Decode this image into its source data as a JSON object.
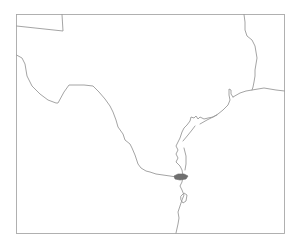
{
  "map": {
    "type": "outline-map",
    "region": "Texas and western Gulf of Mexico coastline",
    "labels": [],
    "colors": {
      "background": "#ffffff",
      "boundary_lines": "#9a9a9a",
      "frame": "#a8a8a8",
      "highlighted_water_body": "#6f6f6f"
    },
    "features": [
      {
        "name": "map-frame",
        "kind": "frame"
      },
      {
        "name": "northwest-panhandle-boundary",
        "kind": "boundary"
      },
      {
        "name": "rio-grande-border",
        "kind": "boundary"
      },
      {
        "name": "sabine-river-border",
        "kind": "boundary"
      },
      {
        "name": "louisiana-coast-line",
        "kind": "boundary"
      },
      {
        "name": "gulf-coastline",
        "kind": "coastline"
      },
      {
        "name": "highlighted-lagoon",
        "kind": "water-body"
      },
      {
        "name": "small-lake",
        "kind": "water-body"
      }
    ]
  }
}
